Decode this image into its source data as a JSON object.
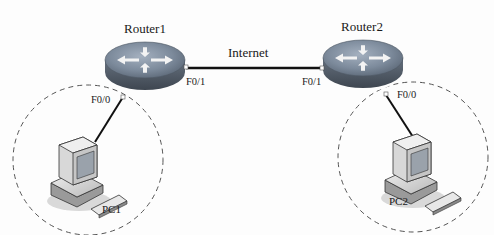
{
  "diagram": {
    "link_label": "Internet",
    "routers": [
      {
        "name": "Router1",
        "port_wan": "F0/1",
        "port_lan": "F0/0"
      },
      {
        "name": "Router2",
        "port_wan": "F0/1",
        "port_lan": "F0/0"
      }
    ],
    "hosts": [
      {
        "name": "PC1"
      },
      {
        "name": "PC2"
      }
    ],
    "colors": {
      "router_top": "#7f8fa3",
      "router_side": "#55606e",
      "link": "#111111",
      "dashed": "#555555"
    }
  }
}
